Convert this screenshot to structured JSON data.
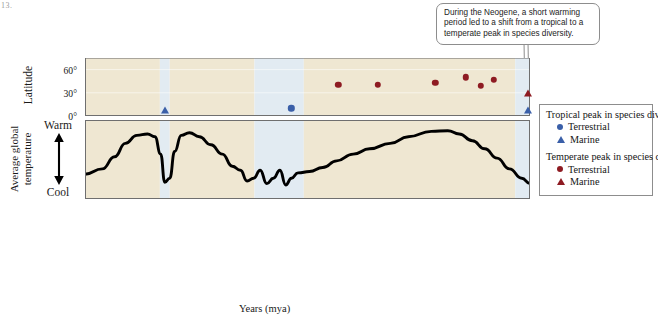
{
  "artifact_text": "13.",
  "callout": {
    "text": "During the Neogene, a short warming period led to a shift from a tropical to a temperate peak in species diversity."
  },
  "legend": {
    "groups": [
      {
        "title": "Tropical peak in species diversity",
        "items": [
          {
            "label": "Terrestrial",
            "marker": "circle",
            "color": "#3a5fa8"
          },
          {
            "label": "Marine",
            "marker": "triangle",
            "color": "#3a5fa8"
          }
        ]
      },
      {
        "title": "Temperate peak in species diversity",
        "items": [
          {
            "label": "Terrestrial",
            "marker": "circle",
            "color": "#8e1b22"
          },
          {
            "label": "Marine",
            "marker": "triangle",
            "color": "#8e1b22"
          }
        ]
      }
    ]
  },
  "axes": {
    "latitude_title": "Latitude",
    "latitude_ticks": [
      "0°",
      "30°",
      "60°"
    ],
    "temperature_title": "Average global temperature",
    "temperature_warm_label": "Warm",
    "temperature_cool_label": "Cool",
    "x_title": "Years (mya)",
    "x_ticks": [
      541,
      485,
      444,
      419,
      359,
      299,
      252,
      201,
      145,
      66,
      23,
      0
    ]
  },
  "colors": {
    "warm_band": "#efe7d2",
    "cool_band": "#e2ebf2",
    "timescale": "#ccd9b4",
    "tropical": "#3a5fa8",
    "temperate": "#8e1b22",
    "curve": "#000000",
    "panel_border": "#6f6f6f"
  },
  "chart_data": {
    "type": "scatter",
    "title": "",
    "xlabel": "Years (mya)",
    "ylabel": "Latitude",
    "xlim": [
      541,
      0
    ],
    "ylim": [
      0,
      75
    ],
    "x_reversed": true,
    "grid": false,
    "legend_position": "right",
    "latitude_points": [
      {
        "age_mya": 444,
        "latitude": 8,
        "group": "tropical",
        "type": "Marine",
        "marker": "triangle",
        "color": "#3a5fa8"
      },
      {
        "age_mya": 290,
        "latitude": 10,
        "group": "tropical",
        "type": "Terrestrial",
        "marker": "circle",
        "color": "#3a5fa8"
      },
      {
        "age_mya": 233,
        "latitude": 40,
        "group": "temperate",
        "type": "Terrestrial",
        "marker": "circle",
        "color": "#8e1b22"
      },
      {
        "age_mya": 185,
        "latitude": 40,
        "group": "temperate",
        "type": "Terrestrial",
        "marker": "circle",
        "color": "#8e1b22"
      },
      {
        "age_mya": 115,
        "latitude": 43,
        "group": "temperate",
        "type": "Terrestrial",
        "marker": "circle",
        "color": "#8e1b22"
      },
      {
        "age_mya": 78,
        "latitude": 50,
        "group": "temperate",
        "type": "Terrestrial",
        "marker": "circle",
        "color": "#8e1b22"
      },
      {
        "age_mya": 60,
        "latitude": 39,
        "group": "temperate",
        "type": "Terrestrial",
        "marker": "circle",
        "color": "#8e1b22"
      },
      {
        "age_mya": 44,
        "latitude": 47,
        "group": "temperate",
        "type": "Terrestrial",
        "marker": "circle",
        "color": "#8e1b22"
      },
      {
        "age_mya": 3,
        "latitude": 30,
        "group": "temperate",
        "type": "Marine",
        "marker": "triangle",
        "color": "#8e1b22"
      },
      {
        "age_mya": 2,
        "latitude": 8,
        "group": "tropical",
        "type": "Marine",
        "marker": "triangle",
        "color": "#3a5fa8"
      }
    ],
    "temperature_curve": {
      "type": "line",
      "note": "Average global temperature, qualitative (Warm at top, Cool at bottom)",
      "points": [
        {
          "age_mya": 541,
          "temp": 0.28
        },
        {
          "age_mya": 520,
          "temp": 0.36
        },
        {
          "age_mya": 505,
          "temp": 0.54
        },
        {
          "age_mya": 492,
          "temp": 0.74
        },
        {
          "age_mya": 478,
          "temp": 0.86
        },
        {
          "age_mya": 465,
          "temp": 0.88
        },
        {
          "age_mya": 456,
          "temp": 0.84
        },
        {
          "age_mya": 449,
          "temp": 0.58
        },
        {
          "age_mya": 444,
          "temp": 0.16
        },
        {
          "age_mya": 438,
          "temp": 0.22
        },
        {
          "age_mya": 432,
          "temp": 0.62
        },
        {
          "age_mya": 424,
          "temp": 0.86
        },
        {
          "age_mya": 414,
          "temp": 0.9
        },
        {
          "age_mya": 402,
          "temp": 0.84
        },
        {
          "age_mya": 388,
          "temp": 0.72
        },
        {
          "age_mya": 374,
          "temp": 0.58
        },
        {
          "age_mya": 362,
          "temp": 0.4
        },
        {
          "age_mya": 352,
          "temp": 0.34
        },
        {
          "age_mya": 344,
          "temp": 0.18
        },
        {
          "age_mya": 336,
          "temp": 0.22
        },
        {
          "age_mya": 328,
          "temp": 0.34
        },
        {
          "age_mya": 320,
          "temp": 0.14
        },
        {
          "age_mya": 312,
          "temp": 0.22
        },
        {
          "age_mya": 304,
          "temp": 0.34
        },
        {
          "age_mya": 297,
          "temp": 0.12
        },
        {
          "age_mya": 290,
          "temp": 0.22
        },
        {
          "age_mya": 282,
          "temp": 0.3
        },
        {
          "age_mya": 268,
          "temp": 0.32
        },
        {
          "age_mya": 252,
          "temp": 0.38
        },
        {
          "age_mya": 235,
          "temp": 0.48
        },
        {
          "age_mya": 215,
          "temp": 0.58
        },
        {
          "age_mya": 195,
          "temp": 0.66
        },
        {
          "age_mya": 170,
          "temp": 0.74
        },
        {
          "age_mya": 148,
          "temp": 0.84
        },
        {
          "age_mya": 120,
          "temp": 0.92
        },
        {
          "age_mya": 100,
          "temp": 0.93
        },
        {
          "age_mya": 86,
          "temp": 0.88
        },
        {
          "age_mya": 70,
          "temp": 0.78
        },
        {
          "age_mya": 55,
          "temp": 0.66
        },
        {
          "age_mya": 40,
          "temp": 0.52
        },
        {
          "age_mya": 25,
          "temp": 0.36
        },
        {
          "age_mya": 10,
          "temp": 0.22
        },
        {
          "age_mya": 0,
          "temp": 0.14
        }
      ]
    },
    "climate_bands": [
      {
        "start_mya": 541,
        "end_mya": 450,
        "state": "warm"
      },
      {
        "start_mya": 450,
        "end_mya": 438,
        "state": "cool"
      },
      {
        "start_mya": 438,
        "end_mya": 335,
        "state": "warm"
      },
      {
        "start_mya": 335,
        "end_mya": 275,
        "state": "cool"
      },
      {
        "start_mya": 275,
        "end_mya": 18,
        "state": "warm"
      },
      {
        "start_mya": 18,
        "end_mya": 0,
        "state": "cool"
      }
    ],
    "periods": [
      {
        "name": "Cambrian",
        "start_mya": 541,
        "end_mya": 485
      },
      {
        "name": "Ordovician",
        "start_mya": 485,
        "end_mya": 444
      },
      {
        "name": "Silurian",
        "start_mya": 444,
        "end_mya": 419
      },
      {
        "name": "Devonian",
        "start_mya": 419,
        "end_mya": 359
      },
      {
        "name": "Carboniferous",
        "start_mya": 359,
        "end_mya": 299
      },
      {
        "name": "Permian",
        "start_mya": 299,
        "end_mya": 252
      },
      {
        "name": "Triassic",
        "start_mya": 252,
        "end_mya": 201
      },
      {
        "name": "Jurassic",
        "start_mya": 201,
        "end_mya": 145
      },
      {
        "name": "Cretaceous",
        "start_mya": 145,
        "end_mya": 66
      },
      {
        "name": "Paleogene",
        "start_mya": 66,
        "end_mya": 23
      },
      {
        "name": "Neogene",
        "start_mya": 23,
        "end_mya": 0
      }
    ]
  }
}
